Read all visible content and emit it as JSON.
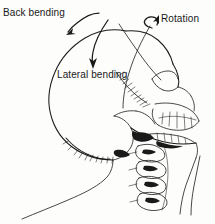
{
  "figure": {
    "background_color": "#fdfdfc",
    "ink_color": "#1a1a1a",
    "width": 215,
    "height": 224
  },
  "annotations": {
    "back_bending": {
      "label": "Back bending",
      "arrow": "curved-arrow-down-left"
    },
    "rotation": {
      "label": "Rotation",
      "arrow": "curved-arrow-up-right"
    },
    "lateral_bending": {
      "label": "Lateral bending",
      "arrow": "curved-arrow-down"
    }
  },
  "anatomy": {
    "parts": [
      "cranium",
      "occiput",
      "frontal-bone",
      "orbit",
      "nasal-bone",
      "maxilla",
      "upper-teeth",
      "mandible",
      "lower-teeth",
      "cervical-vertebrae",
      "neck-contour"
    ]
  }
}
